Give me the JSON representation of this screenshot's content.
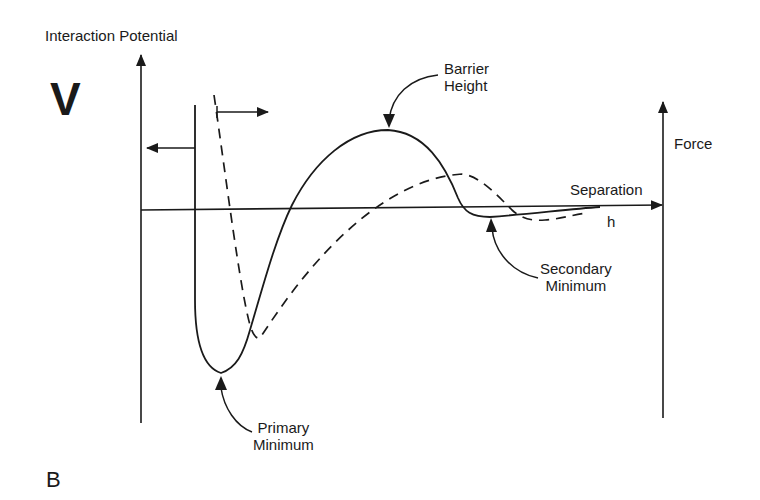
{
  "diagram": {
    "panel_label": "B",
    "y_axis_symbol": "V",
    "left_axis_title": "Interaction Potential",
    "right_axis_title": "Force",
    "x_axis_title": "Separation",
    "x_axis_symbol": "h",
    "annotations": {
      "barrier": [
        "Barrier",
        "Height"
      ],
      "secondary": [
        "Secondary",
        "Minimum"
      ],
      "primary": [
        "Primary",
        "Minimum"
      ]
    },
    "series": [
      {
        "name": "interaction-potential",
        "style": "solid",
        "color": "#1a1a1a"
      },
      {
        "name": "force",
        "style": "dashed",
        "color": "#1a1a1a"
      }
    ]
  }
}
